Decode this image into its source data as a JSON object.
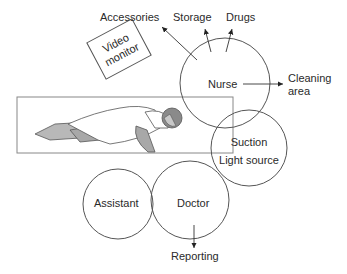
{
  "diagram": {
    "type": "operating-room-layout",
    "video_monitor": {
      "line1": "Video",
      "line2": "monitor"
    },
    "circles": {
      "nurse": "Nurse",
      "suction": {
        "line1": "Suction",
        "line2": "Light source"
      },
      "assistant": "Assistant",
      "doctor": "Doctor"
    },
    "destinations": {
      "accessories": "Accessories",
      "storage": "Storage",
      "drugs": "Drugs",
      "cleaning": {
        "line1": "Cleaning",
        "line2": "area"
      },
      "reporting": "Reporting"
    },
    "colors": {
      "line": "#555555",
      "patient_skin": "#b0b0b0",
      "text": "#2a2a2a"
    }
  }
}
